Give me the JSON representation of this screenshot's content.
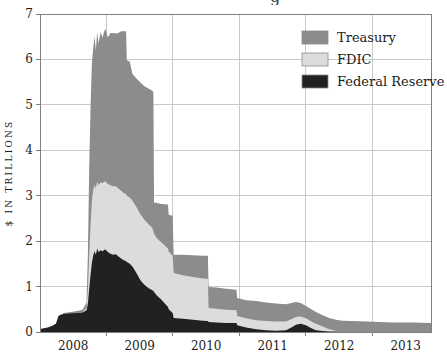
{
  "decor": {
    "cropped_title_fragment": "g"
  },
  "chart_data": {
    "type": "area",
    "stacked": true,
    "title": "",
    "xlabel": "",
    "ylabel": "$ IN TRILLIONS",
    "xlim": [
      2008,
      2013.88
    ],
    "ylim": [
      0,
      7
    ],
    "yticks": [
      0,
      1,
      2,
      3,
      4,
      5,
      6,
      7
    ],
    "xtick_years": [
      2008,
      2009,
      2010,
      2011,
      2012,
      2013
    ],
    "grid": true,
    "legend_position": "upper right",
    "colors": {
      "treasury": "#8c8c8c",
      "fdic": "#dcdcdc",
      "federal_reserve": "#212121",
      "gridline": "#c9c9c9",
      "frame": "#7f7f7f",
      "text": "#1c1c1c"
    },
    "x": [
      2008.0,
      2008.06,
      2008.12,
      2008.18,
      2008.24,
      2008.28,
      2008.36,
      2008.46,
      2008.56,
      2008.64,
      2008.7,
      2008.72,
      2008.74,
      2008.76,
      2008.78,
      2008.8,
      2008.82,
      2008.84,
      2008.86,
      2008.88,
      2008.91,
      2008.94,
      2008.98,
      2009.02,
      2009.06,
      2009.1,
      2009.14,
      2009.18,
      2009.22,
      2009.26,
      2009.295,
      2009.305,
      2009.35,
      2009.39,
      2009.45,
      2009.51,
      2009.57,
      2009.63,
      2009.69,
      2009.705,
      2009.715,
      2009.76,
      2009.82,
      2009.88,
      2009.925,
      2009.935,
      2009.995,
      2010.01,
      2010.15,
      2010.3,
      2010.45,
      2010.525,
      2010.535,
      2010.65,
      2010.8,
      2010.955,
      2010.965,
      2011.1,
      2011.25,
      2011.4,
      2011.55,
      2011.7,
      2011.78,
      2011.85,
      2011.92,
      2012.0,
      2012.08,
      2012.15,
      2012.25,
      2012.35,
      2012.45,
      2012.55,
      2012.7,
      2012.9,
      2013.1,
      2013.3,
      2013.6,
      2013.88
    ],
    "series": [
      {
        "name": "Federal Reserve",
        "color": "#212121",
        "values": [
          0.06,
          0.08,
          0.1,
          0.13,
          0.18,
          0.36,
          0.4,
          0.41,
          0.42,
          0.43,
          0.48,
          0.62,
          0.95,
          1.25,
          1.52,
          1.68,
          1.78,
          1.7,
          1.84,
          1.76,
          1.8,
          1.78,
          1.82,
          1.76,
          1.72,
          1.7,
          1.71,
          1.66,
          1.62,
          1.58,
          1.56,
          1.54,
          1.5,
          1.44,
          1.3,
          1.14,
          1.04,
          0.97,
          0.92,
          0.9,
          0.88,
          0.8,
          0.72,
          0.62,
          0.55,
          0.5,
          0.42,
          0.31,
          0.29,
          0.27,
          0.25,
          0.24,
          0.22,
          0.21,
          0.2,
          0.2,
          0.15,
          0.1,
          0.06,
          0.04,
          0.03,
          0.04,
          0.1,
          0.16,
          0.18,
          0.15,
          0.08,
          0.04,
          0.02,
          0.01,
          0.01,
          0,
          0,
          0,
          0,
          0,
          0,
          0
        ]
      },
      {
        "name": "FDIC",
        "color": "#dcdcdc",
        "values": [
          0,
          0,
          0,
          0,
          0,
          0,
          0,
          0,
          0,
          0.01,
          0.05,
          0.3,
          0.75,
          1.1,
          1.35,
          1.44,
          1.46,
          1.46,
          1.47,
          1.47,
          1.49,
          1.5,
          1.5,
          1.5,
          1.51,
          1.51,
          1.5,
          1.5,
          1.49,
          1.48,
          1.47,
          1.46,
          1.46,
          1.45,
          1.45,
          1.45,
          1.43,
          1.41,
          1.37,
          1.32,
          1.28,
          1.26,
          1.26,
          1.28,
          1.28,
          1.27,
          1.26,
          0.99,
          0.96,
          0.94,
          0.93,
          0.93,
          0.31,
          0.3,
          0.29,
          0.28,
          0.2,
          0.2,
          0.2,
          0.2,
          0.2,
          0.19,
          0.18,
          0.17,
          0.16,
          0.15,
          0.15,
          0.14,
          0.1,
          0.05,
          0.02,
          0,
          0,
          0,
          0,
          0,
          0,
          0
        ]
      },
      {
        "name": "Treasury",
        "color": "#8c8c8c",
        "values": [
          0,
          0,
          0,
          0,
          0,
          0,
          0.02,
          0.03,
          0.04,
          0.05,
          0.12,
          0.8,
          1.9,
          2.6,
          3.03,
          3.13,
          3.26,
          3.04,
          3.29,
          3.12,
          3.31,
          3.2,
          3.36,
          3.22,
          3.35,
          3.37,
          3.36,
          3.42,
          3.51,
          3.56,
          3.59,
          2.98,
          2.99,
          2.79,
          2.83,
          2.9,
          2.94,
          2.98,
          3.02,
          3.06,
          0.69,
          0.78,
          0.84,
          0.91,
          0.97,
          0.81,
          0.88,
          0.4,
          0.45,
          0.48,
          0.5,
          0.51,
          0.46,
          0.47,
          0.46,
          0.45,
          0.4,
          0.4,
          0.42,
          0.41,
          0.4,
          0.38,
          0.36,
          0.33,
          0.3,
          0.27,
          0.27,
          0.26,
          0.25,
          0.25,
          0.24,
          0.25,
          0.24,
          0.23,
          0.22,
          0.21,
          0.21,
          0.2
        ]
      }
    ],
    "legend": [
      {
        "label": "Treasury",
        "color": "#8c8c8c"
      },
      {
        "label": "FDIC",
        "color": "#dcdcdc"
      },
      {
        "label": "Federal Reserve",
        "color": "#212121"
      }
    ]
  }
}
